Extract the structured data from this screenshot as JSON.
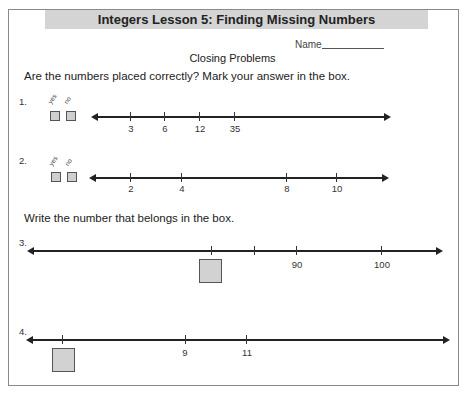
{
  "header": {
    "title": "Integers Lesson 5: Finding Missing Numbers",
    "name_label": "Name",
    "subtitle": "Closing Problems"
  },
  "section1": {
    "instruction": "Are the numbers placed correctly? Mark your answer in the box.",
    "yes_label": "yes",
    "no_label": "no",
    "problems": [
      {
        "number": "1.",
        "ticks": [
          "3",
          "6",
          "12",
          "35"
        ]
      },
      {
        "number": "2.",
        "ticks": [
          "2",
          "4",
          "8",
          "10"
        ]
      }
    ]
  },
  "section2": {
    "instruction": "Write the number that belongs in the box.",
    "problems": [
      {
        "number": "3.",
        "ticks": [
          "",
          "",
          "90",
          "100"
        ],
        "box_under_tick": 0
      },
      {
        "number": "4.",
        "ticks": [
          "",
          "9",
          "11"
        ],
        "box_under_tick": 0
      }
    ]
  },
  "colors": {
    "title_bar": "#d4d4d4",
    "box_fill": "#d2d2d2",
    "line": "#222222"
  }
}
